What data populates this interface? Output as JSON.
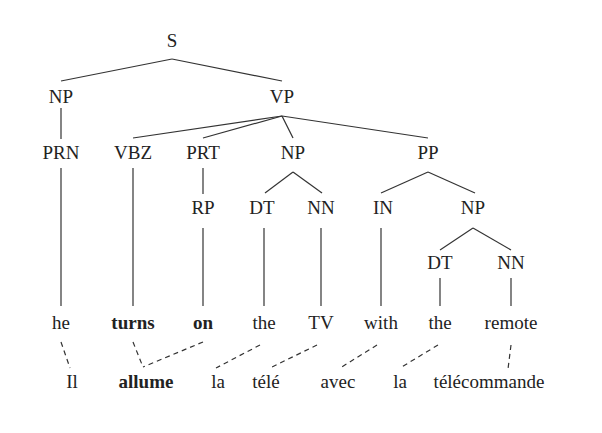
{
  "tree": {
    "nodes": [
      {
        "id": "S",
        "label": "S",
        "x": 172,
        "y": 41
      },
      {
        "id": "NP1",
        "label": "NP",
        "x": 61,
        "y": 97
      },
      {
        "id": "VP",
        "label": "VP",
        "x": 282,
        "y": 97
      },
      {
        "id": "PRN",
        "label": "PRN",
        "x": 61,
        "y": 153
      },
      {
        "id": "VBZ",
        "label": "VBZ",
        "x": 133,
        "y": 153
      },
      {
        "id": "PRT",
        "label": "PRT",
        "x": 203,
        "y": 153
      },
      {
        "id": "NP2",
        "label": "NP",
        "x": 293,
        "y": 153
      },
      {
        "id": "PP",
        "label": "PP",
        "x": 428,
        "y": 153
      },
      {
        "id": "RP",
        "label": "RP",
        "x": 203,
        "y": 208
      },
      {
        "id": "DT1",
        "label": "DT",
        "x": 262,
        "y": 208
      },
      {
        "id": "NN1",
        "label": "NN",
        "x": 321,
        "y": 208
      },
      {
        "id": "IN",
        "label": "IN",
        "x": 383,
        "y": 208
      },
      {
        "id": "NP3",
        "label": "NP",
        "x": 473,
        "y": 208
      },
      {
        "id": "DT2",
        "label": "DT",
        "x": 440,
        "y": 263
      },
      {
        "id": "NN2",
        "label": "NN",
        "x": 511,
        "y": 263
      }
    ],
    "english_words": [
      {
        "text": "he",
        "x": 61,
        "y": 323,
        "bold": false
      },
      {
        "text": "turns",
        "x": 133,
        "y": 323,
        "bold": true
      },
      {
        "text": "on",
        "x": 203,
        "y": 323,
        "bold": true
      },
      {
        "text": "the",
        "x": 264,
        "y": 323,
        "bold": false
      },
      {
        "text": "TV",
        "x": 321,
        "y": 323,
        "bold": false
      },
      {
        "text": "with",
        "x": 381,
        "y": 323,
        "bold": false
      },
      {
        "text": "the",
        "x": 440,
        "y": 323,
        "bold": false
      },
      {
        "text": "remote",
        "x": 511,
        "y": 323,
        "bold": false
      }
    ],
    "french_words": [
      {
        "text": "Il",
        "x": 72,
        "y": 382,
        "bold": false
      },
      {
        "text": "allume",
        "x": 146,
        "y": 382,
        "bold": true
      },
      {
        "text": "la",
        "x": 218,
        "y": 382,
        "bold": false
      },
      {
        "text": "télé",
        "x": 266,
        "y": 382,
        "bold": false
      },
      {
        "text": "avec",
        "x": 338,
        "y": 382,
        "bold": false
      },
      {
        "text": "la",
        "x": 400,
        "y": 382,
        "bold": false
      },
      {
        "text": "télécommande",
        "x": 489,
        "y": 382,
        "bold": false
      }
    ],
    "edges": [
      [
        172,
        59,
        61,
        81
      ],
      [
        172,
        59,
        282,
        81
      ],
      [
        61,
        108,
        61,
        139
      ],
      [
        282,
        116,
        133,
        138
      ],
      [
        282,
        116,
        203,
        138
      ],
      [
        282,
        116,
        293,
        138
      ],
      [
        282,
        116,
        428,
        138
      ],
      [
        203,
        168,
        203,
        194
      ],
      [
        293,
        172,
        265,
        193
      ],
      [
        293,
        172,
        322,
        193
      ],
      [
        428,
        172,
        381,
        193
      ],
      [
        428,
        172,
        475,
        193
      ],
      [
        473,
        228,
        440,
        250
      ],
      [
        473,
        228,
        511,
        250
      ],
      [
        61,
        168,
        61,
        306
      ],
      [
        133,
        168,
        133,
        306
      ],
      [
        203,
        228,
        203,
        306
      ],
      [
        264,
        228,
        264,
        306
      ],
      [
        321,
        228,
        321,
        306
      ],
      [
        381,
        228,
        381,
        306
      ],
      [
        440,
        278,
        440,
        306
      ],
      [
        511,
        278,
        511,
        306
      ]
    ],
    "alignments": [
      [
        61,
        342,
        70,
        368
      ],
      [
        133,
        342,
        143,
        367
      ],
      [
        203,
        342,
        143,
        367
      ],
      [
        260,
        345,
        216,
        368
      ],
      [
        317,
        345,
        270,
        368
      ],
      [
        377,
        345,
        340,
        368
      ],
      [
        438,
        345,
        400,
        368
      ],
      [
        511,
        345,
        508,
        369
      ]
    ],
    "line_color": "#333333"
  }
}
